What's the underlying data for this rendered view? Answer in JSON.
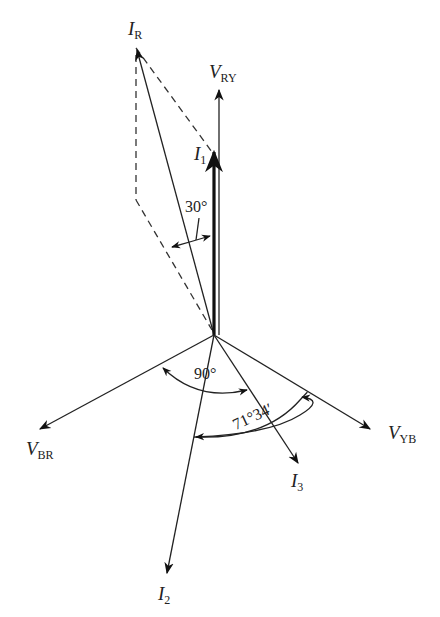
{
  "diagram": {
    "type": "phasor-diagram",
    "origin": {
      "x": 214,
      "y": 335
    },
    "phasors": [
      {
        "id": "V_RY",
        "symbol": "V",
        "subscript": "RY",
        "tip": {
          "x": 219,
          "y": 88
        }
      },
      {
        "id": "V_YB",
        "symbol": "V",
        "subscript": "YB",
        "tip": {
          "x": 372,
          "y": 430
        }
      },
      {
        "id": "V_BR",
        "symbol": "V",
        "subscript": "BR",
        "tip": {
          "x": 38,
          "y": 430
        }
      },
      {
        "id": "I_R",
        "symbol": "I",
        "subscript": "R",
        "tip": {
          "x": 136,
          "y": 48
        }
      },
      {
        "id": "I_1",
        "symbol": "I",
        "subscript": "1",
        "tip": {
          "x": 214,
          "y": 150
        }
      },
      {
        "id": "I_2",
        "symbol": "I",
        "subscript": "2",
        "tip": {
          "x": 166,
          "y": 575
        }
      },
      {
        "id": "I_3",
        "symbol": "I",
        "subscript": "3",
        "tip": {
          "x": 299,
          "y": 465
        }
      }
    ],
    "angles": [
      {
        "label": "30°",
        "between": [
          "I_1",
          "I_R construction"
        ]
      },
      {
        "label": "90°",
        "between": [
          "V_BR",
          "I_3"
        ]
      },
      {
        "label": "71°34′",
        "between": [
          "I_2",
          "V_YB"
        ]
      }
    ],
    "labels": {
      "V_RY": {
        "main": "V",
        "sub": "RY"
      },
      "V_YB": {
        "main": "V",
        "sub": "YB"
      },
      "V_BR": {
        "main": "V",
        "sub": "BR"
      },
      "I_R": {
        "main": "I",
        "sub": "R"
      },
      "I_1": {
        "main": "I",
        "sub": "1"
      },
      "I_2": {
        "main": "I",
        "sub": "2"
      },
      "I_3": {
        "main": "I",
        "sub": "3"
      },
      "angle_30": "30°",
      "angle_90": "90°",
      "angle_71": "71°34′"
    }
  }
}
